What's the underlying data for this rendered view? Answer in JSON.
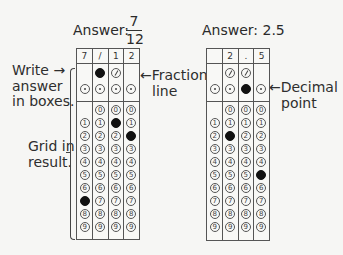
{
  "left": {
    "answer_label": "Answer:",
    "answer_numerator": "7",
    "answer_denominator": "12",
    "header_cells": [
      "7",
      "/",
      "1",
      "2"
    ],
    "filled": {
      "slash": [
        false,
        true,
        false,
        false
      ],
      "decimal": [
        false,
        false,
        false,
        false
      ],
      "digit": [
        7,
        null,
        1,
        2
      ]
    },
    "has_slash": [
      false,
      true,
      true,
      false
    ],
    "has_zero": [
      false,
      true,
      true,
      true
    ],
    "annotation_write": [
      "Write →",
      "answer",
      "in boxes."
    ],
    "annotation_grid": [
      "Grid in",
      "result."
    ],
    "annotation_fraction": [
      "←Fraction",
      "line"
    ]
  },
  "right": {
    "answer_label": "Answer: 2.5",
    "header_cells": [
      "",
      "2",
      ".",
      "5"
    ],
    "filled": {
      "slash": [
        false,
        false,
        false,
        false
      ],
      "decimal": [
        false,
        false,
        true,
        false
      ],
      "digit": [
        null,
        2,
        null,
        5
      ]
    },
    "has_slash": [
      false,
      true,
      true,
      false
    ],
    "has_zero": [
      false,
      true,
      true,
      true
    ],
    "annotation_decimal": [
      "←Decimal",
      "point"
    ]
  },
  "digits": [
    "0",
    "1",
    "2",
    "3",
    "4",
    "5",
    "6",
    "7",
    "8",
    "9"
  ],
  "colors": {
    "ink": "#111111",
    "line": "#555555",
    "paper": "#f6f6f4"
  }
}
